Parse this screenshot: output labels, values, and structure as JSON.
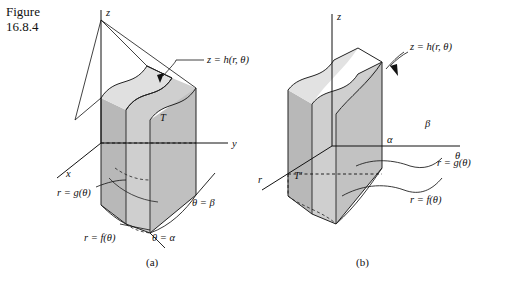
{
  "figure": {
    "label_line1": "Figure",
    "label_line2": "16.8.4"
  },
  "panels": [
    {
      "id": "a",
      "caption": "(a)",
      "axes": [
        {
          "name": "z-axis-label",
          "text": "z"
        },
        {
          "name": "y-axis-label",
          "text": "y"
        },
        {
          "name": "x-axis-label",
          "text": "x"
        }
      ],
      "annotations": [
        {
          "name": "surface-label",
          "text": "z = h(r, θ)"
        },
        {
          "name": "solid-label",
          "text": "T"
        },
        {
          "name": "inner-radius-label",
          "text": "r = g(θ)"
        },
        {
          "name": "outer-radius-label",
          "text": "r = f(θ)"
        },
        {
          "name": "theta-beta-label",
          "text": "θ = β"
        },
        {
          "name": "theta-alpha-label",
          "text": "θ = α"
        }
      ]
    },
    {
      "id": "b",
      "caption": "(b)",
      "axes": [
        {
          "name": "z-axis-label",
          "text": "z"
        },
        {
          "name": "r-axis-label",
          "text": "r"
        },
        {
          "name": "theta-axis-label",
          "text": "θ"
        }
      ],
      "annotations": [
        {
          "name": "surface-label",
          "text": "z = h(r, θ)"
        },
        {
          "name": "solid-label",
          "text": "T′"
        },
        {
          "name": "alpha-label",
          "text": "α"
        },
        {
          "name": "beta-label",
          "text": "β"
        },
        {
          "name": "inner-radius-label",
          "text": "r = g(θ)"
        },
        {
          "name": "outer-radius-label",
          "text": "r = f(θ)"
        }
      ]
    }
  ],
  "colors": {
    "ink": "#111111",
    "shade_light": "#d8d8d8",
    "shade_mid": "#c4c4c4",
    "shade_dark": "#ababab",
    "background": "#ffffff"
  }
}
